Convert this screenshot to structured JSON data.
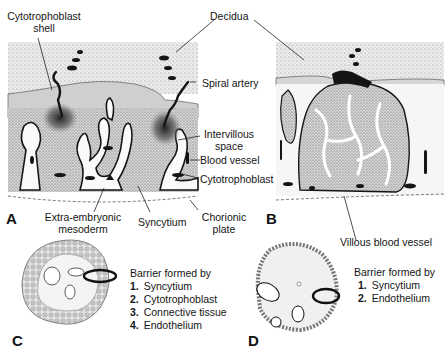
{
  "panel_a": {
    "letter": "A",
    "labels": {
      "cytotrophoblast_shell_1": "Cytotrophoblast",
      "cytotrophoblast_shell_2": "shell",
      "spiral_artery": "Spiral artery",
      "intervillous_space_1": "Intervillous",
      "intervillous_space_2": "space",
      "blood_vessel": "Blood vessel",
      "cytotrophoblast": "Cytotrophoblast",
      "extra_embryonic_1": "Extra-embryonic",
      "extra_embryonic_2": "mesoderm",
      "syncytium": "Syncytium",
      "chorionic_plate_1": "Chorionic",
      "chorionic_plate_2": "plate"
    }
  },
  "shared": {
    "decidua": "Decidua"
  },
  "panel_b": {
    "letter": "B",
    "labels": {
      "villous_blood_vessel": "Villous blood vessel"
    }
  },
  "panel_c": {
    "letter": "C",
    "barrier_title": "Barrier formed by",
    "barrier_items": [
      {
        "num": "1.",
        "label": "Syncytium"
      },
      {
        "num": "2.",
        "label": "Cytotrophoblast"
      },
      {
        "num": "3.",
        "label": "Connective tissue"
      },
      {
        "num": "4.",
        "label": "Endothelium"
      }
    ]
  },
  "panel_d": {
    "letter": "D",
    "barrier_title": "Barrier formed by",
    "barrier_items": [
      {
        "num": "1.",
        "label": "Syncytium"
      },
      {
        "num": "2.",
        "label": "Endothelium"
      }
    ]
  },
  "colors": {
    "ink": "#151515",
    "decidua_fill": "#e6e6e6",
    "shell_fill": "#d2d2d2",
    "villus_fill": "#cfcfcf",
    "space_fill": "#ffffff"
  }
}
